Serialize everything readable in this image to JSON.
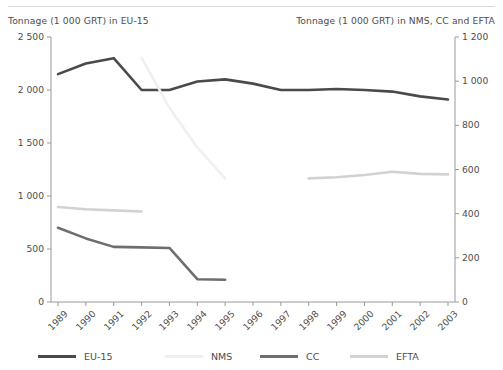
{
  "header": {
    "left_axis_title": "Tonnage (1 000 GRT) in EU-15",
    "right_axis_title": "Tonnage (1 000 GRT) in NMS, CC and EFTA"
  },
  "colors": {
    "eu15": "#4a4a4a",
    "nms": "#f0f0f0",
    "cc": "#6e6e6e",
    "efta": "#d2d2d2",
    "axis": "#9a9a9a",
    "text": "#4d4d4d",
    "rule": "#d9d9d9",
    "background": "#ffffff"
  },
  "legend": {
    "position": "bottom",
    "items": [
      {
        "label": "EU-15",
        "color": "#4a4a4a"
      },
      {
        "label": "NMS",
        "color": "#f0f0f0"
      },
      {
        "label": "CC",
        "color": "#6e6e6e"
      },
      {
        "label": "EFTA",
        "color": "#d2d2d2"
      }
    ]
  },
  "chart_data": {
    "type": "line",
    "title": "",
    "subtitle": "",
    "xlabel": "",
    "ylabel": "Tonnage (1 000 GRT) in EU-15",
    "y2label": "Tonnage (1 000 GRT) in NMS, CC and EFTA",
    "grid": false,
    "legend_position": "bottom",
    "categories": [
      "1989",
      "1990",
      "1991",
      "1992",
      "1993",
      "1994",
      "1995",
      "1996",
      "1997",
      "1998",
      "1999",
      "2000",
      "2001",
      "2002",
      "2003"
    ],
    "x_tick_labels": [
      "1989",
      "1990",
      "1991",
      "1992",
      "1993",
      "1994",
      "1995",
      "1996",
      "1997",
      "1998",
      "1999",
      "2000",
      "2001",
      "2002",
      "2003"
    ],
    "x_tick_rotation": -45,
    "ylim": [
      0,
      2500
    ],
    "y_ticks": [
      0,
      500,
      1000,
      1500,
      2000,
      2500
    ],
    "y_tick_labels": [
      "0",
      "500",
      "1 000",
      "1 500",
      "2 000",
      "2 500"
    ],
    "y2lim": [
      0,
      1200
    ],
    "y2_ticks": [
      0,
      200,
      400,
      600,
      800,
      1000,
      1200
    ],
    "y2_tick_labels": [
      "0",
      "200",
      "400",
      "600",
      "800",
      "1 000",
      "1 200"
    ],
    "series": [
      {
        "name": "EU-15",
        "axis": "left",
        "color": "#4a4a4a",
        "x": [
          "1989",
          "1990",
          "1991",
          "1992",
          "1993",
          "1994",
          "1995",
          "1996",
          "1997",
          "1998",
          "1999",
          "2000",
          "2001",
          "2002",
          "2003"
        ],
        "values": [
          2150,
          2250,
          2300,
          2000,
          2000,
          2080,
          2100,
          2060,
          2000,
          2000,
          2010,
          2000,
          1985,
          1940,
          1910
        ]
      },
      {
        "name": "NMS",
        "axis": "right",
        "color": "#f0f0f0",
        "x": [
          "1992",
          "1993",
          "1994",
          "1995"
        ],
        "values": [
          1105,
          880,
          700,
          560
        ]
      },
      {
        "name": "CC",
        "axis": "left",
        "color": "#6e6e6e",
        "x": [
          "1989",
          "1990",
          "1991",
          "1992",
          "1993",
          "1994",
          "1995"
        ],
        "values": [
          700,
          600,
          520,
          515,
          510,
          215,
          210
        ]
      },
      {
        "name": "EFTA",
        "axis": "right",
        "color": "#d2d2d2",
        "segments": [
          {
            "x": [
              "1989",
              "1990",
              "1991",
              "1992"
            ],
            "values": [
              430,
              420,
              415,
              410
            ]
          },
          {
            "x": [
              "1998",
              "1999",
              "2000",
              "2001",
              "2002",
              "2003"
            ],
            "values": [
              560,
              565,
              575,
              590,
              580,
              578
            ]
          }
        ]
      }
    ]
  }
}
